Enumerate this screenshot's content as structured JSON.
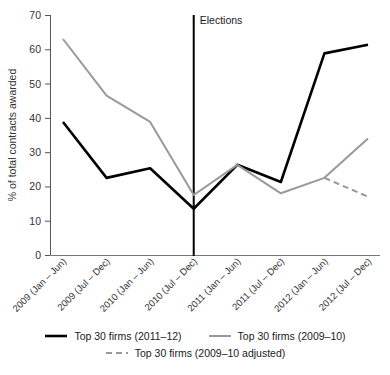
{
  "chart_data": {
    "type": "line",
    "title": "",
    "xlabel": "",
    "ylabel": "% of total contracts awarded",
    "ylim": [
      0,
      70
    ],
    "yticks": [
      0,
      10,
      20,
      30,
      40,
      50,
      60,
      70
    ],
    "grid": false,
    "legend_position": "bottom",
    "categories": [
      "2009 (Jan – Jun)",
      "2009 (Jul – Dec)",
      "2010 (Jan – Jun)",
      "2010 (Jul – Dec)",
      "2011 (Jan – Jun)",
      "2011 (Jul – Dec)",
      "2012 (Jan – Jun)",
      "2012 (Jul – Dec)"
    ],
    "series": [
      {
        "name": "Top 30 firms (2011–12)",
        "color": "#000000",
        "style": "solid",
        "values": [
          38.8,
          22.5,
          25.3,
          13.5,
          26.3,
          21.3,
          58.8,
          61.3
        ]
      },
      {
        "name": "Top 30 firms (2009–10)",
        "color": "#999999",
        "style": "solid",
        "values": [
          63.0,
          46.5,
          38.8,
          17.5,
          26.3,
          18.0,
          22.5,
          34.0
        ]
      },
      {
        "name": "Top 30 firms (2009–10 adjusted)",
        "color": "#999999",
        "style": "dashed",
        "values": [
          null,
          null,
          null,
          null,
          null,
          null,
          22.5,
          17.0
        ]
      }
    ],
    "annotations": [
      {
        "label": "Elections",
        "type": "vertical-line",
        "at_category": "2010 (Jul – Dec)",
        "color": "#000000"
      }
    ]
  },
  "legend": {
    "items": [
      {
        "label": "Top 30 firms (2011–12)",
        "color": "#000000",
        "style": "solid"
      },
      {
        "label": "Top 30 firms (2009–10)",
        "color": "#999999",
        "style": "solid"
      },
      {
        "label": "Top 30 firms (2009–10 adjusted)",
        "color": "#999999",
        "style": "dashed"
      }
    ]
  }
}
